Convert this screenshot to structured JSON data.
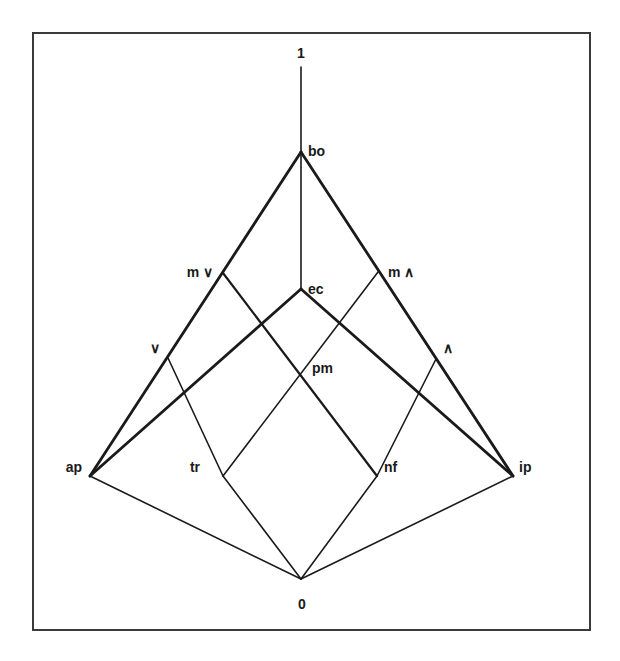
{
  "diagram": {
    "type": "lattice",
    "nodes": [
      {
        "id": "one",
        "label": "1",
        "x": 301,
        "y": 67,
        "lx": 301,
        "ly": 58,
        "anchor": "middle"
      },
      {
        "id": "bo",
        "label": "bo",
        "x": 301,
        "y": 152,
        "lx": 308,
        "ly": 156,
        "anchor": "start"
      },
      {
        "id": "mv",
        "label": "m ∨",
        "x": 223,
        "y": 273,
        "lx": 213,
        "ly": 277,
        "anchor": "end"
      },
      {
        "id": "mw",
        "label": "m ∧",
        "x": 378,
        "y": 272,
        "lx": 388,
        "ly": 277,
        "anchor": "start"
      },
      {
        "id": "ec",
        "label": "ec",
        "x": 301,
        "y": 289,
        "lx": 308,
        "ly": 294,
        "anchor": "start"
      },
      {
        "id": "v",
        "label": "∨",
        "x": 168,
        "y": 358,
        "lx": 160,
        "ly": 353,
        "anchor": "end"
      },
      {
        "id": "w",
        "label": "∧",
        "x": 436,
        "y": 359,
        "lx": 443,
        "ly": 353,
        "anchor": "start"
      },
      {
        "id": "pm",
        "label": "pm",
        "x": 303,
        "y": 377,
        "lx": 312,
        "ly": 373,
        "anchor": "start"
      },
      {
        "id": "ap",
        "label": "ap",
        "x": 90,
        "y": 476,
        "lx": 82,
        "ly": 472,
        "anchor": "end"
      },
      {
        "id": "tr",
        "label": "tr",
        "x": 223,
        "y": 476,
        "lx": 200,
        "ly": 472,
        "anchor": "end"
      },
      {
        "id": "nf",
        "label": "nf",
        "x": 377,
        "y": 476,
        "lx": 384,
        "ly": 472,
        "anchor": "start"
      },
      {
        "id": "ip",
        "label": "ip",
        "x": 513,
        "y": 476,
        "lx": 519,
        "ly": 472,
        "anchor": "start"
      },
      {
        "id": "zero",
        "label": "0",
        "x": 301,
        "y": 579,
        "lx": 302,
        "ly": 609,
        "anchor": "middle"
      }
    ],
    "edges": [
      {
        "from": "one",
        "to": "bo",
        "weight": "thin"
      },
      {
        "from": "bo",
        "to": "ec",
        "weight": "thin"
      },
      {
        "from": "bo",
        "to": "ap",
        "weight": "thick"
      },
      {
        "from": "bo",
        "to": "ip",
        "weight": "thick"
      },
      {
        "from": "ec",
        "to": "ap",
        "weight": "thick"
      },
      {
        "from": "ec",
        "to": "ip",
        "weight": "thick"
      },
      {
        "from": "mv",
        "to": "nf",
        "weight": "medium"
      },
      {
        "from": "mw",
        "to": "tr",
        "weight": "thin"
      },
      {
        "from": "v",
        "to": "tr",
        "weight": "thin"
      },
      {
        "from": "w",
        "to": "nf",
        "weight": "thin"
      },
      {
        "from": "ap",
        "to": "zero",
        "weight": "thin"
      },
      {
        "from": "tr",
        "to": "zero",
        "weight": "thin"
      },
      {
        "from": "nf",
        "to": "zero",
        "weight": "thin"
      },
      {
        "from": "ip",
        "to": "zero",
        "weight": "thin"
      }
    ]
  }
}
